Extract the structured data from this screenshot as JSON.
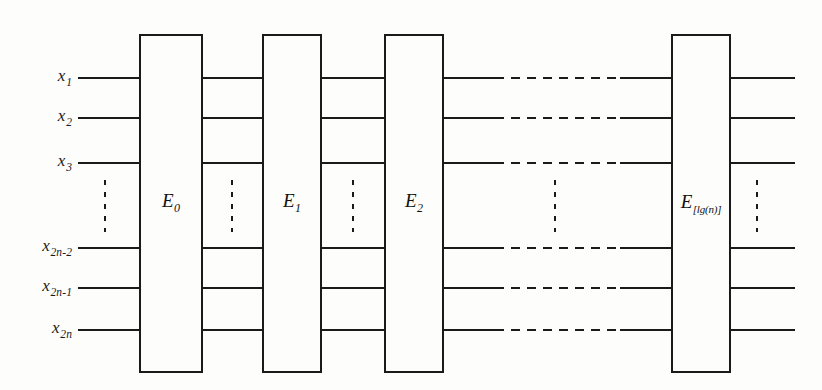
{
  "figure": {
    "kind": "comparator-network-diagram",
    "background_color": "#fdfdfb",
    "line_color": "#1a1a1a",
    "width": 822,
    "height": 390
  },
  "wires": {
    "x_start": 78,
    "x_end": 795,
    "rows": [
      {
        "label_base": "x",
        "label_sub": "1",
        "y": 78
      },
      {
        "label_base": "x",
        "label_sub": "2",
        "y": 118
      },
      {
        "label_base": "x",
        "label_sub": "3",
        "y": 163
      },
      {
        "label_base": "x",
        "label_sub": "2n-2",
        "y": 248
      },
      {
        "label_base": "x",
        "label_sub": "2n-1",
        "y": 288
      },
      {
        "label_base": "x",
        "label_sub": "2n",
        "y": 330
      }
    ],
    "label_x": 72,
    "dashed_gap": {
      "x_start": 495,
      "x_end": 620
    }
  },
  "stages": [
    {
      "label_base": "E",
      "label_sub": "0",
      "x": 140,
      "width": 62,
      "wide_sub": false
    },
    {
      "label_base": "E",
      "label_sub": "1",
      "x": 263,
      "width": 58,
      "wide_sub": false
    },
    {
      "label_base": "E",
      "label_sub": "2",
      "x": 385,
      "width": 58,
      "wide_sub": false
    },
    {
      "label_base": "E",
      "label_sub": "[lg(n)]",
      "x": 672,
      "width": 58,
      "wide_sub": true
    }
  ],
  "stage_box": {
    "y_top": 35,
    "y_bottom": 372,
    "label_y": 203
  },
  "vertical_ellipses": [
    {
      "x": 105,
      "y_top": 180,
      "y_bottom": 232
    },
    {
      "x": 232,
      "y_top": 180,
      "y_bottom": 232
    },
    {
      "x": 353,
      "y_top": 180,
      "y_bottom": 232
    },
    {
      "x": 555,
      "y_top": 180,
      "y_bottom": 232
    },
    {
      "x": 757,
      "y_top": 180,
      "y_bottom": 232
    }
  ]
}
